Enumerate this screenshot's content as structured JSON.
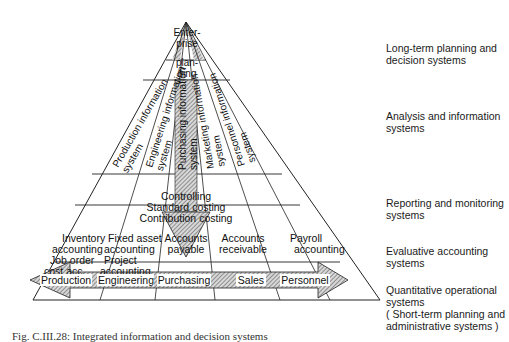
{
  "diagram": {
    "apex": {
      "label_lines": [
        "Enter-",
        "prise",
        "plan-",
        "ning"
      ]
    },
    "analysis_columns": [
      {
        "lines": [
          "Production information",
          "system"
        ]
      },
      {
        "lines": [
          "Engineering information",
          "system"
        ]
      },
      {
        "lines": [
          "Purchasing information",
          "system"
        ]
      },
      {
        "lines": [
          "Marketing information",
          "system"
        ]
      },
      {
        "lines": [
          "Personnel information",
          "system"
        ]
      }
    ],
    "reporting_band": {
      "lines": [
        "Controlling",
        "Standard costing",
        "Contribution costing"
      ]
    },
    "evaluative_cells": [
      {
        "lines": [
          "Inventory",
          "accounting",
          "Job order",
          "cost acc."
        ]
      },
      {
        "lines": [
          "Fixed asset",
          "accounting",
          "Project",
          "accounting"
        ]
      },
      {
        "lines": [
          "Accounts",
          "payable"
        ]
      },
      {
        "lines": [
          "Accounts",
          "receivable"
        ]
      },
      {
        "lines": [
          "Payroll",
          "accounting"
        ]
      }
    ],
    "operational_functions": [
      "Production",
      "Engineering",
      "Purchasing",
      "Sales",
      "Personnel"
    ]
  },
  "levels": [
    {
      "label": "Long-term planning  and\ndecision systems"
    },
    {
      "label": "Analysis and information\nsystems"
    },
    {
      "label": "Reporting and monitoring\nsystems"
    },
    {
      "label": "Evaluative accounting\nsystems"
    },
    {
      "label": "Quantitative operational\nsystems\n( Short-term planning and\nadministrative systems )"
    }
  ],
  "caption": "Fig. C.III.28: Integrated information and decision systems",
  "colors": {
    "line": "#222222",
    "hatch": "#555555",
    "background": "#ffffff"
  }
}
